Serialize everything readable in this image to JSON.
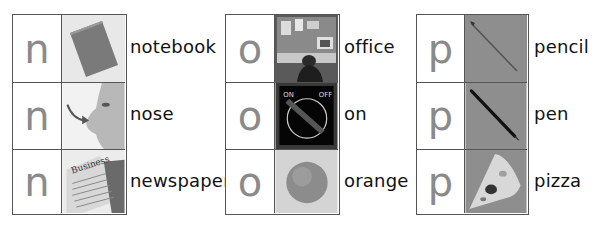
{
  "groups": [
    {
      "letter": "n",
      "items": [
        {
          "word": "notebook",
          "picture": "notebook-image"
        },
        {
          "word": "nose",
          "picture": "nose-image"
        },
        {
          "word": "newspaper",
          "picture": "newspaper-image",
          "picture_text": "Business"
        }
      ]
    },
    {
      "letter": "o",
      "items": [
        {
          "word": "office",
          "picture": "office-image"
        },
        {
          "word": "on",
          "picture": "on-switch-image",
          "picture_text_left": "ON",
          "picture_text_right": "OFF"
        },
        {
          "word": "orange",
          "picture": "orange-image"
        }
      ]
    },
    {
      "letter": "p",
      "items": [
        {
          "word": "pencil",
          "picture": "pencil-image"
        },
        {
          "word": "pen",
          "picture": "pen-image"
        },
        {
          "word": "pizza",
          "picture": "pizza-image"
        }
      ]
    }
  ],
  "colors": {
    "border": "#555555",
    "letter": "#8a8a8a",
    "word": "#111111"
  }
}
